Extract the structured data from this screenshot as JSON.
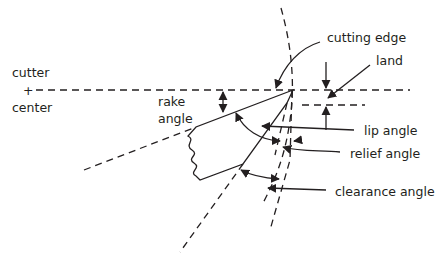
{
  "diagram": {
    "labels": {
      "cutter_center_top": "cutter",
      "cutter_center_mark": "+",
      "cutter_center_bottom": "center",
      "rake_line1": "rake",
      "rake_line2": "angle",
      "cutting_edge": "cutting edge",
      "land": "land",
      "lip_angle": "lip angle",
      "relief_angle": "relief angle",
      "clearance_angle": "clearance angle"
    },
    "colors": {
      "ink": "#231f20",
      "background": "#ffffff"
    }
  }
}
